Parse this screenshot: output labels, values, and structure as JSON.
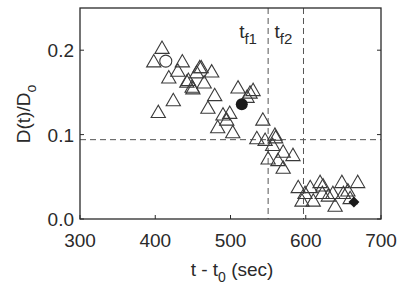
{
  "chart_data": {
    "type": "scatter",
    "title": "",
    "xlabel": "t - t0 (sec)",
    "xlabel_main": "t - t",
    "xlabel_sub": "0",
    "xlabel_tail": " (sec)",
    "ylabel": "D(t)/D0",
    "ylabel_main": "D(t)/D",
    "ylabel_sub": "o",
    "xlim": [
      300,
      700
    ],
    "ylim": [
      0.0,
      0.25
    ],
    "xticks": [
      300,
      400,
      500,
      600,
      700
    ],
    "xtick_labels": [
      "300",
      "400",
      "500",
      "600",
      "700"
    ],
    "yticks": [
      0.0,
      0.1,
      0.2
    ],
    "ytick_labels": [
      "0.0",
      "0.1",
      "0.2"
    ],
    "grid": false,
    "legend": null,
    "reference_lines": {
      "horizontal": [
        {
          "y": 0.094,
          "style": "dashed"
        }
      ],
      "vertical": [
        {
          "x": 550,
          "style": "dashed",
          "label": "tf1",
          "label_main": "t",
          "label_sub": "f1"
        },
        {
          "x": 597,
          "style": "dashed",
          "label": "tf2",
          "label_main": "t",
          "label_sub": "f2"
        }
      ]
    },
    "series": [
      {
        "name": "measurements",
        "marker": "open-triangle",
        "points": [
          [
            409,
            0.202
          ],
          [
            398,
            0.186
          ],
          [
            436,
            0.186
          ],
          [
            430,
            0.175
          ],
          [
            461,
            0.179
          ],
          [
            418,
            0.167
          ],
          [
            444,
            0.164
          ],
          [
            449,
            0.156
          ],
          [
            424,
            0.14
          ],
          [
            404,
            0.126
          ],
          [
            459,
            0.179
          ],
          [
            475,
            0.174
          ],
          [
            455,
            0.173
          ],
          [
            442,
            0.162
          ],
          [
            465,
            0.161
          ],
          [
            450,
            0.154
          ],
          [
            479,
            0.146
          ],
          [
            470,
            0.131
          ],
          [
            510,
            0.155
          ],
          [
            526,
            0.149
          ],
          [
            530,
            0.152
          ],
          [
            522,
            0.144
          ],
          [
            499,
            0.125
          ],
          [
            490,
            0.123
          ],
          [
            495,
            0.117
          ],
          [
            483,
            0.108
          ],
          [
            503,
            0.102
          ],
          [
            543,
            0.117
          ],
          [
            535,
            0.095
          ],
          [
            559,
            0.099
          ],
          [
            546,
            0.093
          ],
          [
            556,
            0.087
          ],
          [
            560,
            0.096
          ],
          [
            550,
            0.071
          ],
          [
            570,
            0.079
          ],
          [
            583,
            0.075
          ],
          [
            563,
            0.069
          ],
          [
            570,
            0.06
          ],
          [
            590,
            0.037
          ],
          [
            606,
            0.037
          ],
          [
            599,
            0.03
          ],
          [
            595,
            0.021
          ],
          [
            610,
            0.021
          ],
          [
            619,
            0.043
          ],
          [
            623,
            0.039
          ],
          [
            622,
            0.03
          ],
          [
            630,
            0.027
          ],
          [
            636,
            0.03
          ],
          [
            639,
            0.015
          ],
          [
            648,
            0.043
          ],
          [
            650,
            0.03
          ],
          [
            656,
            0.033
          ],
          [
            669,
            0.043
          ],
          [
            659,
            0.024
          ]
        ]
      },
      {
        "name": "open-circle-point",
        "marker": "open-circle",
        "points": [
          [
            414,
            0.187
          ]
        ]
      },
      {
        "name": "filled-circle-point",
        "marker": "filled-circle",
        "points": [
          [
            515,
            0.136
          ]
        ]
      },
      {
        "name": "filled-diamond-point",
        "marker": "filled-diamond",
        "points": [
          [
            664,
            0.02
          ]
        ]
      }
    ]
  },
  "colors": {
    "axis": "#2a2a2a",
    "marker_stroke": "#3a3a3a",
    "marker_fill_solid": "#1a1a1a",
    "dashed_line": "#555555",
    "background": "#ffffff"
  },
  "layout": {
    "plot_left": 80,
    "plot_right": 381,
    "plot_top": 8,
    "plot_bottom": 219
  }
}
